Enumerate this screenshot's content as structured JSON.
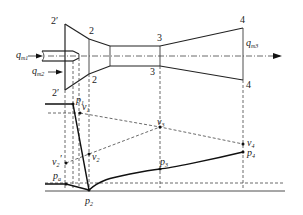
{
  "diagram": {
    "section_labels": {
      "s2prime_top": "2′",
      "s2prime_bottom": "2′",
      "s2_top": "2",
      "s2_bottom": "2",
      "s3_top": "3",
      "s3_bottom": "3",
      "s4_top": "4",
      "s4_bottom": "4"
    },
    "flow_labels": {
      "qm1_base": "q",
      "qm1_sub": "m1",
      "qm2_base": "q",
      "qm2_sub": "m2",
      "qm3_base": "q",
      "qm3_sub": "m3"
    },
    "curve_labels": {
      "p1_base": "p",
      "p1_sub": "1",
      "v1_base": "v",
      "v1_sub": "1",
      "v2prime_base": "v",
      "v2prime_sub": "2",
      "v2prime_mark": "′",
      "v2_base": "v",
      "v2_sub": "2",
      "pa_base": "p",
      "pa_sub": "a",
      "p2_base": "p",
      "p2_sub": "2",
      "v3_base": "v",
      "v3_sub": "3",
      "p3_base": "p",
      "p3_sub": "3",
      "v4_base": "v",
      "v4_sub": "4",
      "p4_base": "p",
      "p4_sub": "4"
    }
  }
}
